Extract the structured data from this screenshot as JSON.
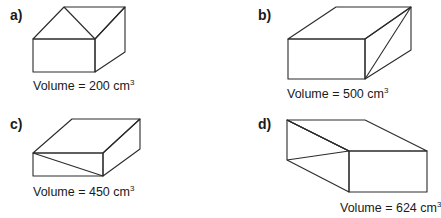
{
  "figures": [
    {
      "label": "a)",
      "volume_text": "Volume = 200 cm",
      "volume_value": 200,
      "unit_sup": "3",
      "fill": "#c4c4c4",
      "shape": "cuboid",
      "note": "top face split by a diagonal line"
    },
    {
      "label": "b)",
      "volume_text": "Volume = 500 cm",
      "volume_value": 500,
      "unit_sup": "3",
      "fill": "#ececec",
      "shape": "cuboid",
      "note": "right face split by a diagonal line"
    },
    {
      "label": "c)",
      "volume_text": "Volume = 450 cm",
      "volume_value": 450,
      "unit_sup": "3",
      "fill": "#c4c4c4",
      "shape": "cuboid",
      "note": "front face split by a diagonal line"
    },
    {
      "label": "d)",
      "volume_text": "Volume = 624 cm",
      "volume_value": 624,
      "unit_sup": "3",
      "fill": "#c4c4c4",
      "shape": "cuboid",
      "note": "left face split by diagonal lines"
    }
  ]
}
